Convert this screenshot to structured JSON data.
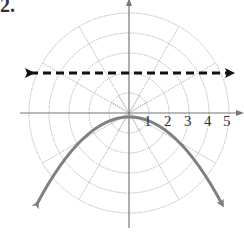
{
  "problem": {
    "label": "2."
  },
  "graph": {
    "type": "polar-grid",
    "center": [
      129,
      113
    ],
    "ring_spacing_px": 20,
    "rings": [
      1,
      2,
      3,
      4,
      5
    ],
    "ray_angles_deg": [
      0,
      30,
      60,
      90,
      120,
      150,
      180,
      210,
      240,
      270,
      300,
      330
    ],
    "tick_labels": [
      "1",
      "2",
      "3",
      "4",
      "5"
    ],
    "colors": {
      "grid": "#b8b8b8",
      "axis": "#777777",
      "curve": "#808080",
      "dashed": "#111111"
    },
    "dashed_line": {
      "description": "horizontal dashed line with arrows both ends",
      "y_value": 2
    },
    "curve": {
      "description": "downward-opening parabola with arrowheads",
      "vertex_r": 1,
      "vertex_theta_deg": 90
    }
  }
}
